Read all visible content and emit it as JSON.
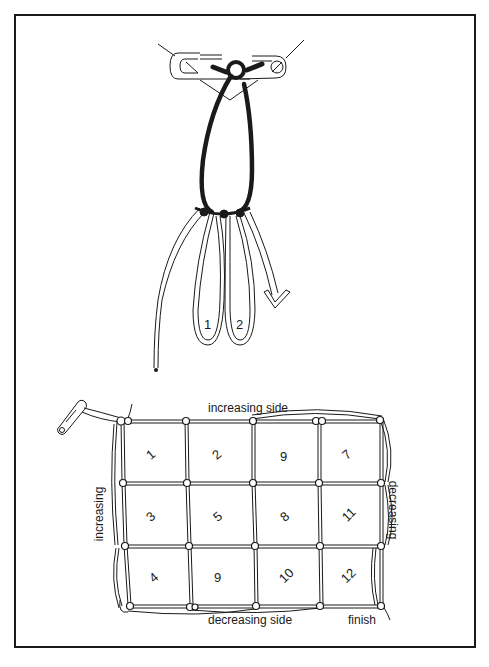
{
  "figure": {
    "top_diagram": {
      "description": "Starting loop tied to a safety pin with first two mesh loops",
      "loop_labels": [
        "1",
        "2"
      ]
    },
    "bottom_diagram": {
      "description": "Net worked diagonally, meshes numbered in working order",
      "labels": {
        "top": "increasing side",
        "left": "increasing",
        "right": "decreasing",
        "bottom": "decreasing side",
        "finish": "finish"
      },
      "grid": {
        "rows": 3,
        "cols": 4,
        "mesh_numbers": [
          [
            "1",
            "2",
            "6",
            "7"
          ],
          [
            "3",
            "5",
            "8",
            "11"
          ],
          [
            "4",
            "9",
            "10",
            "12"
          ]
        ]
      }
    },
    "colors": {
      "ink": "#1a1a1a",
      "paper": "#ffffff"
    }
  }
}
